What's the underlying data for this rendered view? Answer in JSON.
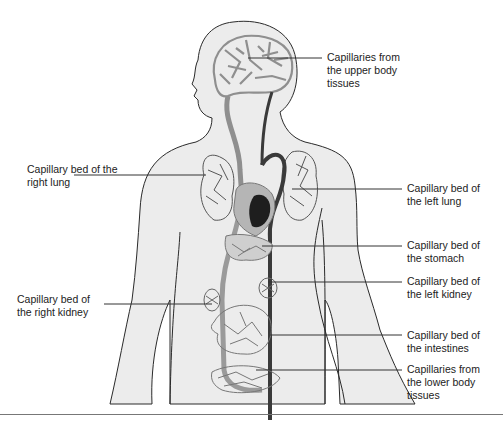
{
  "diagram": {
    "colors": {
      "body_fill": "#ececec",
      "body_outline": "#2a2a2a",
      "vessel_light": "#9a9a9a",
      "vessel_dark": "#3a3a3a",
      "heart_dark": "#1e1e1e",
      "leader_line": "#333333",
      "text": "#222222"
    },
    "labels": [
      {
        "id": "upper-body",
        "text": "Capillaries from\nthe upper body\ntissues",
        "side": "right"
      },
      {
        "id": "right-lung",
        "text": "Capillary bed of the\nright lung",
        "side": "left"
      },
      {
        "id": "left-lung",
        "text": "Capillary bed of\nthe left lung",
        "side": "right"
      },
      {
        "id": "stomach",
        "text": "Capillary bed of\nthe stomach",
        "side": "right"
      },
      {
        "id": "left-kidney",
        "text": "Capillary bed of\nthe left kidney",
        "side": "right"
      },
      {
        "id": "right-kidney",
        "text": "Capillary bed of\nthe right kidney",
        "side": "left"
      },
      {
        "id": "intestines",
        "text": "Capillary bed of\nthe intestines",
        "side": "right"
      },
      {
        "id": "lower-body",
        "text": "Capillaries from\nthe lower body\ntissues",
        "side": "right"
      }
    ]
  }
}
